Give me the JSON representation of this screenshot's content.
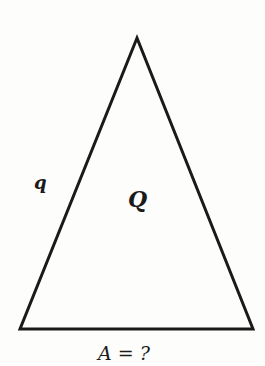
{
  "diagram": {
    "shape": "isosceles-triangle",
    "side_label": "q",
    "area_label": "Q",
    "base_label": "A = ?",
    "stroke_color": "#1a1a1a",
    "background": "#fdfdfb"
  }
}
